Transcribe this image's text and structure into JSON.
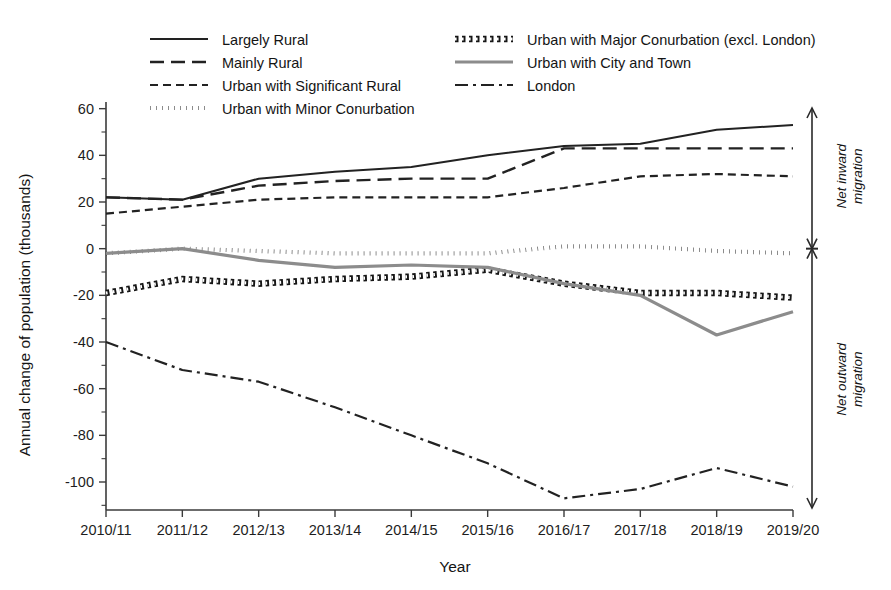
{
  "chart_data": {
    "type": "line",
    "title": "",
    "xlabel": "Year",
    "ylabel": "Annual change of population (thousands)",
    "categories": [
      "2010/11",
      "2011/12",
      "2012/13",
      "2013/14",
      "2014/15",
      "2015/16",
      "2016/17",
      "2017/18",
      "2018/19",
      "2019/20"
    ],
    "ylim": [
      -112,
      62
    ],
    "yticks": [
      60,
      40,
      20,
      0,
      -20,
      -40,
      -60,
      -80,
      -100
    ],
    "ytick_labels": [
      "60",
      "40",
      "20",
      "0",
      "-20",
      "-40",
      "-60",
      "-80",
      "-100"
    ],
    "minor_ticks": true,
    "grid": false,
    "legend_position": "top",
    "series": [
      {
        "name": "Largely Rural",
        "style": "solid",
        "color": "#222222",
        "width": 2.0,
        "dash": "none",
        "values": [
          22,
          21,
          30,
          33,
          35,
          40,
          44,
          45,
          51,
          53
        ]
      },
      {
        "name": "Mainly Rural",
        "style": "long-dash",
        "color": "#222222",
        "width": 2.4,
        "dash": "14,7",
        "values": [
          22,
          21,
          27,
          29,
          30,
          30,
          43,
          43,
          43,
          43
        ]
      },
      {
        "name": "Urban with Significant Rural",
        "style": "short-dash",
        "color": "#222222",
        "width": 2.2,
        "dash": "8,5",
        "values": [
          15,
          18,
          21,
          22,
          22,
          22,
          26,
          31,
          32,
          31
        ]
      },
      {
        "name": "Urban with Minor Conurbation",
        "style": "dotted",
        "color": "#1a1a1a",
        "width": 4.2,
        "dash": "0.5,5.5",
        "values": [
          -2,
          0,
          -1,
          -2,
          -2,
          -2,
          1,
          1,
          -1,
          -2
        ]
      },
      {
        "name": "Urban with Major Conurbation (excl. London)",
        "style": "thick-dotted",
        "color": "#161616",
        "width": 6.5,
        "dash": "3.5,3.5",
        "values": [
          -19,
          -13,
          -15,
          -13,
          -12,
          -9,
          -15,
          -19,
          -19,
          -21
        ]
      },
      {
        "name": "Urban with City and Town",
        "style": "solid-gray",
        "color": "#8c8c8c",
        "width": 3.2,
        "dash": "none",
        "values": [
          -2,
          0,
          -5,
          -8,
          -7,
          -8,
          -15,
          -20,
          -37,
          -27
        ]
      },
      {
        "name": "London",
        "style": "dash-dot",
        "color": "#222222",
        "width": 2.2,
        "dash": "13,5,3,5",
        "values": [
          -40,
          -52,
          -57,
          -68,
          -80,
          -92,
          -107,
          -103,
          -94,
          -102
        ]
      }
    ],
    "annotations": [
      {
        "text_line1": "Net inward",
        "text_line2": "migration",
        "direction": "up"
      },
      {
        "text_line1": "Net outward",
        "text_line2": "migration",
        "direction": "down"
      }
    ]
  }
}
